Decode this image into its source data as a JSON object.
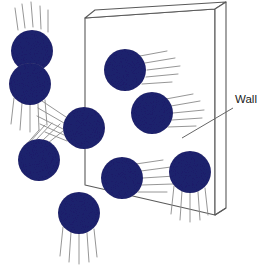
{
  "figure": {
    "type": "diagram",
    "background_color": "#ffffff",
    "width": 273,
    "height": 269
  },
  "labels": [
    {
      "id": "wall",
      "text": "Wall",
      "x": 235,
      "y": 104,
      "color": "#1a1a1a",
      "font_size": 11.5,
      "leader_line": {
        "x1": 233,
        "y1": 108,
        "x2": 182,
        "y2": 138
      }
    }
  ],
  "wall": {
    "name": "wall-slab",
    "outline_color": "#555555",
    "face_color": "#ffffff",
    "edge_color": "#6b6b6b",
    "front_face": [
      {
        "x": 85,
        "y": 18
      },
      {
        "x": 215,
        "y": 9
      },
      {
        "x": 215,
        "y": 215
      },
      {
        "x": 85,
        "y": 185
      }
    ],
    "top_face": [
      {
        "x": 85,
        "y": 18
      },
      {
        "x": 95,
        "y": 10
      },
      {
        "x": 226,
        "y": 2
      },
      {
        "x": 215,
        "y": 9
      }
    ],
    "side_face": [
      {
        "x": 215,
        "y": 9
      },
      {
        "x": 226,
        "y": 2
      },
      {
        "x": 226,
        "y": 208
      },
      {
        "x": 215,
        "y": 215
      }
    ],
    "bottom_edge": [
      {
        "x": 215,
        "y": 215
      },
      {
        "x": 226,
        "y": 208
      }
    ]
  },
  "molecules": [
    {
      "id": "molecule-1",
      "name": "gas-molecule",
      "cx": 32,
      "cy": 51,
      "r": 21,
      "color": "#1e2170",
      "location": "left-of-wall",
      "motion": "downward",
      "trails": [
        {
          "x1": 18,
          "y1": 30,
          "x2": 15,
          "y2": 8
        },
        {
          "x1": 25,
          "y1": 28,
          "x2": 22,
          "y2": 4
        },
        {
          "x1": 33,
          "y1": 27,
          "x2": 31,
          "y2": 2
        },
        {
          "x1": 41,
          "y1": 29,
          "x2": 40,
          "y2": 6
        },
        {
          "x1": 48,
          "y1": 32,
          "x2": 48,
          "y2": 10
        }
      ]
    },
    {
      "id": "molecule-2",
      "name": "gas-molecule",
      "cx": 30,
      "cy": 84,
      "r": 21,
      "color": "#1e2170",
      "location": "left-of-wall",
      "motion": "downward",
      "trails": [
        {
          "x1": 14,
          "y1": 98,
          "x2": 11,
          "y2": 124
        },
        {
          "x1": 22,
          "y1": 103,
          "x2": 20,
          "y2": 130
        },
        {
          "x1": 30,
          "y1": 105,
          "x2": 30,
          "y2": 132
        },
        {
          "x1": 38,
          "y1": 104,
          "x2": 39,
          "y2": 130
        },
        {
          "x1": 45,
          "y1": 100,
          "x2": 47,
          "y2": 125
        }
      ]
    },
    {
      "id": "molecule-3",
      "name": "gas-molecule",
      "cx": 84,
      "cy": 128,
      "r": 21,
      "color": "#1e2170",
      "location": "at-wall-left-edge",
      "motion": "diagonal-upper-left",
      "trails": [
        {
          "x1": 66,
          "y1": 117,
          "x2": 42,
          "y2": 101
        },
        {
          "x1": 64,
          "y1": 123,
          "x2": 38,
          "y2": 108
        },
        {
          "x1": 63,
          "y1": 129,
          "x2": 37,
          "y2": 116
        },
        {
          "x1": 64,
          "y1": 135,
          "x2": 40,
          "y2": 124
        },
        {
          "x1": 67,
          "y1": 141,
          "x2": 45,
          "y2": 132
        }
      ]
    },
    {
      "id": "molecule-4",
      "name": "gas-molecule",
      "cx": 39,
      "cy": 160,
      "r": 21,
      "color": "#1e2170",
      "location": "left-of-wall",
      "motion": "diagonal-upper-right",
      "trails": [
        {
          "x1": 48,
          "y1": 143,
          "x2": 68,
          "y2": 127
        },
        {
          "x1": 42,
          "y1": 141,
          "x2": 60,
          "y2": 124
        },
        {
          "x1": 36,
          "y1": 140,
          "x2": 52,
          "y2": 123
        },
        {
          "x1": 30,
          "y1": 142,
          "x2": 45,
          "y2": 125
        },
        {
          "x1": 25,
          "y1": 146,
          "x2": 39,
          "y2": 130
        }
      ]
    },
    {
      "id": "molecule-5",
      "name": "gas-molecule",
      "cx": 79,
      "cy": 213,
      "r": 21,
      "color": "#1e2170",
      "location": "below-left-of-wall",
      "motion": "downward",
      "trails": [
        {
          "x1": 63,
          "y1": 227,
          "x2": 60,
          "y2": 256
        },
        {
          "x1": 71,
          "y1": 232,
          "x2": 69,
          "y2": 262
        },
        {
          "x1": 79,
          "y1": 234,
          "x2": 79,
          "y2": 264
        },
        {
          "x1": 87,
          "y1": 233,
          "x2": 89,
          "y2": 262
        },
        {
          "x1": 94,
          "y1": 229,
          "x2": 97,
          "y2": 257
        }
      ]
    },
    {
      "id": "molecule-6",
      "name": "gas-molecule",
      "cx": 125,
      "cy": 70,
      "r": 21,
      "color": "#1e2170",
      "location": "on-wall",
      "motion": "rightward",
      "trails": [
        {
          "x1": 140,
          "y1": 56,
          "x2": 167,
          "y2": 51
        },
        {
          "x1": 145,
          "y1": 63,
          "x2": 175,
          "y2": 58
        },
        {
          "x1": 147,
          "y1": 70,
          "x2": 180,
          "y2": 66
        },
        {
          "x1": 146,
          "y1": 77,
          "x2": 178,
          "y2": 74
        },
        {
          "x1": 142,
          "y1": 84,
          "x2": 172,
          "y2": 82
        }
      ]
    },
    {
      "id": "molecule-7",
      "name": "gas-molecule",
      "cx": 152,
      "cy": 113,
      "r": 21,
      "color": "#1e2170",
      "location": "on-wall",
      "motion": "rightward",
      "trails": [
        {
          "x1": 166,
          "y1": 99,
          "x2": 193,
          "y2": 94
        },
        {
          "x1": 171,
          "y1": 106,
          "x2": 200,
          "y2": 101
        },
        {
          "x1": 173,
          "y1": 113,
          "x2": 204,
          "y2": 110
        },
        {
          "x1": 172,
          "y1": 120,
          "x2": 202,
          "y2": 118
        },
        {
          "x1": 168,
          "y1": 127,
          "x2": 196,
          "y2": 126
        }
      ]
    },
    {
      "id": "molecule-8",
      "name": "gas-molecule",
      "cx": 122,
      "cy": 178,
      "r": 21,
      "color": "#1e2170",
      "location": "on-wall",
      "motion": "rightward",
      "trails": [
        {
          "x1": 136,
          "y1": 164,
          "x2": 163,
          "y2": 160
        },
        {
          "x1": 141,
          "y1": 171,
          "x2": 171,
          "y2": 167
        },
        {
          "x1": 143,
          "y1": 178,
          "x2": 175,
          "y2": 176
        },
        {
          "x1": 142,
          "y1": 185,
          "x2": 173,
          "y2": 184
        },
        {
          "x1": 138,
          "y1": 192,
          "x2": 167,
          "y2": 192
        }
      ]
    },
    {
      "id": "molecule-9",
      "name": "gas-molecule",
      "cx": 190,
      "cy": 172,
      "r": 21,
      "color": "#1e2170",
      "location": "on-wall",
      "motion": "downward",
      "trails": [
        {
          "x1": 174,
          "y1": 186,
          "x2": 171,
          "y2": 214
        },
        {
          "x1": 182,
          "y1": 191,
          "x2": 180,
          "y2": 220
        },
        {
          "x1": 190,
          "y1": 193,
          "x2": 190,
          "y2": 222
        },
        {
          "x1": 198,
          "y1": 192,
          "x2": 200,
          "y2": 220
        },
        {
          "x1": 205,
          "y1": 188,
          "x2": 208,
          "y2": 215
        }
      ]
    }
  ],
  "style": {
    "molecule_color": "#1e2170",
    "trail_color": "#8a8a8a",
    "trail_width": 0.9,
    "wall_line_color": "#5a5a5a",
    "wall_line_width": 1.1,
    "label_color": "#1a1a1a",
    "leader_color": "#666666"
  }
}
